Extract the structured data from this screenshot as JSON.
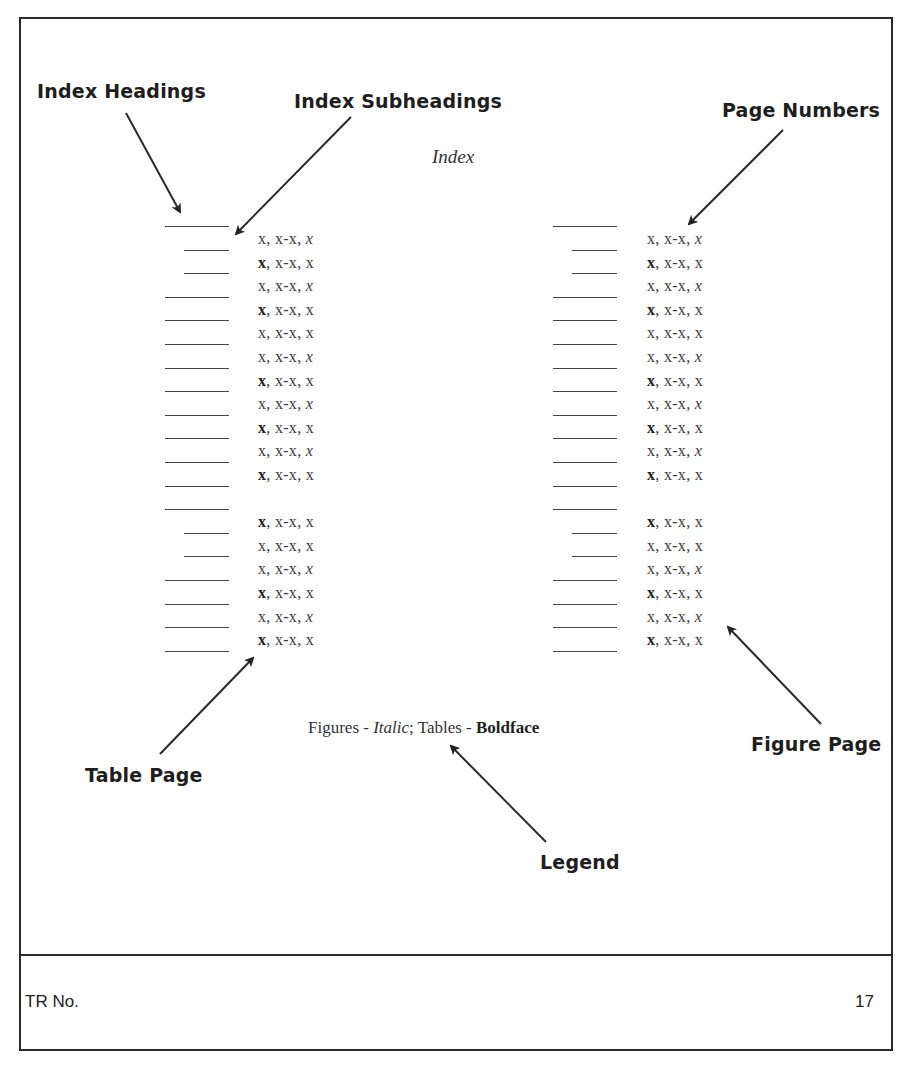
{
  "document": {
    "title": "Index",
    "legend": {
      "figures_label": "Figures - ",
      "figures_style": "Italic",
      "separator": "; Tables - ",
      "tables_style": "Boldface"
    },
    "footer": {
      "report_label": "TR No.",
      "page_number": "17"
    }
  },
  "annotations": {
    "index_headings": "Index Headings",
    "index_subheadings": "Index Subheadings",
    "page_numbers": "Page Numbers",
    "table_page": "Table Page",
    "figure_page": "Figure Page",
    "legend": "Legend"
  },
  "index_columns": {
    "line_rows": [
      {
        "type": "heading"
      },
      {
        "type": "subheading"
      },
      {
        "type": "subheading"
      },
      {
        "type": "heading"
      },
      {
        "type": "heading"
      },
      {
        "type": "heading"
      },
      {
        "type": "heading"
      },
      {
        "type": "heading"
      },
      {
        "type": "heading"
      },
      {
        "type": "heading"
      },
      {
        "type": "heading"
      },
      {
        "type": "heading"
      },
      {
        "type": "heading"
      },
      {
        "type": "subheading"
      },
      {
        "type": "subheading"
      },
      {
        "type": "heading"
      },
      {
        "type": "heading"
      },
      {
        "type": "heading"
      },
      {
        "type": "heading"
      }
    ],
    "entries": [
      {
        "first": "x",
        "first_style": "normal",
        "range": ", x-x, ",
        "last": "x",
        "last_style": "italic"
      },
      {
        "first": "x",
        "first_style": "bold",
        "range": ", x-x, ",
        "last": "x",
        "last_style": "normal"
      },
      {
        "first": "x",
        "first_style": "normal",
        "range": ", x-x, ",
        "last": "x",
        "last_style": "italic"
      },
      {
        "first": "x",
        "first_style": "bold",
        "range": ", x-x, ",
        "last": "x",
        "last_style": "normal"
      },
      {
        "first": "x",
        "first_style": "normal",
        "range": ", x-x, ",
        "last": "x",
        "last_style": "normal"
      },
      {
        "first": "x",
        "first_style": "normal",
        "range": ", x-x, ",
        "last": "x",
        "last_style": "italic"
      },
      {
        "first": "x",
        "first_style": "bold",
        "range": ", x-x, ",
        "last": "x",
        "last_style": "normal"
      },
      {
        "first": "x",
        "first_style": "normal",
        "range": ", x-x, ",
        "last": "x",
        "last_style": "italic"
      },
      {
        "first": "x",
        "first_style": "bold",
        "range": ", x-x, ",
        "last": "x",
        "last_style": "normal"
      },
      {
        "first": "x",
        "first_style": "normal",
        "range": ", x-x, ",
        "last": "x",
        "last_style": "italic"
      },
      {
        "first": "x",
        "first_style": "bold",
        "range": ", x-x, ",
        "last": "x",
        "last_style": "normal"
      },
      null,
      {
        "first": "x",
        "first_style": "bold",
        "range": ", x-x, ",
        "last": "x",
        "last_style": "normal"
      },
      {
        "first": "x",
        "first_style": "normal",
        "range": ", x-x, ",
        "last": "x",
        "last_style": "normal"
      },
      {
        "first": "x",
        "first_style": "normal",
        "range": ", x-x, ",
        "last": "x",
        "last_style": "italic"
      },
      {
        "first": "x",
        "first_style": "bold",
        "range": ", x-x, ",
        "last": "x",
        "last_style": "normal"
      },
      {
        "first": "x",
        "first_style": "normal",
        "range": ", x-x, ",
        "last": "x",
        "last_style": "italic"
      },
      {
        "first": "x",
        "first_style": "bold",
        "range": ", x-x, ",
        "last": "x",
        "last_style": "normal"
      }
    ]
  },
  "colors": {
    "ink": "#1e1e1e",
    "text_gray": "#3a3a3a",
    "border": "#2a2a2a"
  }
}
